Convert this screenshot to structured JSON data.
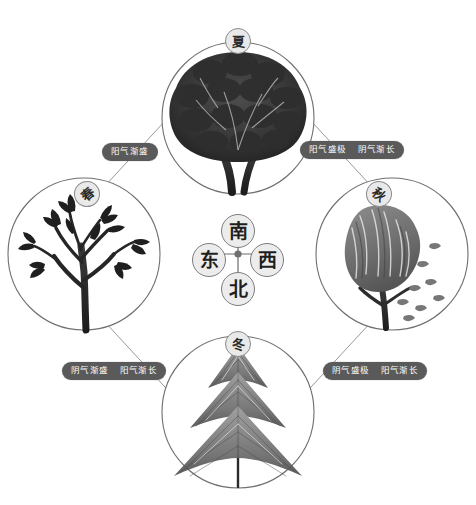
{
  "diagram": {
    "center": {
      "compass": {
        "south": "南",
        "north": "北",
        "east": "东",
        "west": "西"
      },
      "hub_color": "#6f6f6f"
    },
    "seasons": [
      {
        "id": "spring",
        "badge": "春",
        "position": "left",
        "tree": "bare-budding-tree",
        "tree_description": "稀疏枝条新芽树"
      },
      {
        "id": "summer",
        "badge": "夏",
        "position": "top",
        "tree": "dense-foliage-tree",
        "tree_description": "浓密深色树冠"
      },
      {
        "id": "autumn",
        "badge": "秋",
        "position": "right",
        "tree": "windswept-falling-leaves-tree",
        "tree_description": "风吹落叶树"
      },
      {
        "id": "winter",
        "badge": "冬",
        "position": "bottom",
        "tree": "conifer-fir-tree",
        "tree_description": "针叶松柏"
      }
    ],
    "phase_labels": [
      {
        "id": "spring-to-summer",
        "position": "upper-left",
        "parts": [
          "阳气渐盛"
        ]
      },
      {
        "id": "summer-to-autumn",
        "position": "upper-right",
        "parts": [
          "阳气盛极",
          "阴气渐长"
        ]
      },
      {
        "id": "winter-to-spring",
        "position": "lower-left",
        "parts": [
          "阴气渐盛",
          "阳气渐长"
        ]
      },
      {
        "id": "autumn-to-winter",
        "position": "lower-right",
        "parts": [
          "阴气盛极",
          "阳气渐长"
        ]
      }
    ],
    "colors": {
      "stroke": "#8d8d8d",
      "pill_bg": "#5a5a5a",
      "pill_text": "#ffffff",
      "badge_bg": "#e9e9e9",
      "ink": "#2b2b2b"
    }
  }
}
